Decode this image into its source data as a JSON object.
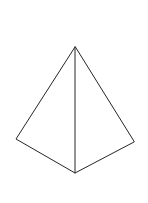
{
  "figure": {
    "name": "square-pyramid-wireframe",
    "kind": "line-drawing",
    "caption": "",
    "background_color": "#ffffff",
    "stroke_color": "#262626",
    "stroke_width": 1,
    "canvas": {
      "width": 148,
      "height": 203
    },
    "vertices": {
      "apex": {
        "label": "apex",
        "x": 75,
        "y": 47
      },
      "base_left": {
        "label": "base-left-corner",
        "x": 16,
        "y": 139
      },
      "base_front": {
        "label": "base-front-corner",
        "x": 75,
        "y": 173
      },
      "base_right": {
        "label": "base-right-corner",
        "x": 134,
        "y": 142
      }
    },
    "edges": [
      {
        "name": "apex-to-base-left",
        "from": "apex",
        "to": "base_left",
        "style": "solid"
      },
      {
        "name": "apex-to-base-right",
        "from": "apex",
        "to": "base_right",
        "style": "solid"
      },
      {
        "name": "apex-to-base-front",
        "from": "apex",
        "to": "base_front",
        "style": "solid"
      },
      {
        "name": "base-left-to-front",
        "from": "base_left",
        "to": "base_front",
        "style": "solid"
      },
      {
        "name": "base-front-to-right",
        "from": "base_front",
        "to": "base_right",
        "style": "solid"
      }
    ],
    "paths": {
      "left_face": "M 75 47 L 16 139 L 75 173 Z",
      "right_face": "M 75 47 L 134 142 L 75 173 Z",
      "outline": "M 75 47 L 16 139 L 75 173 L 134 142 Z",
      "front_edge": "M 75 47 L 75 173"
    }
  }
}
